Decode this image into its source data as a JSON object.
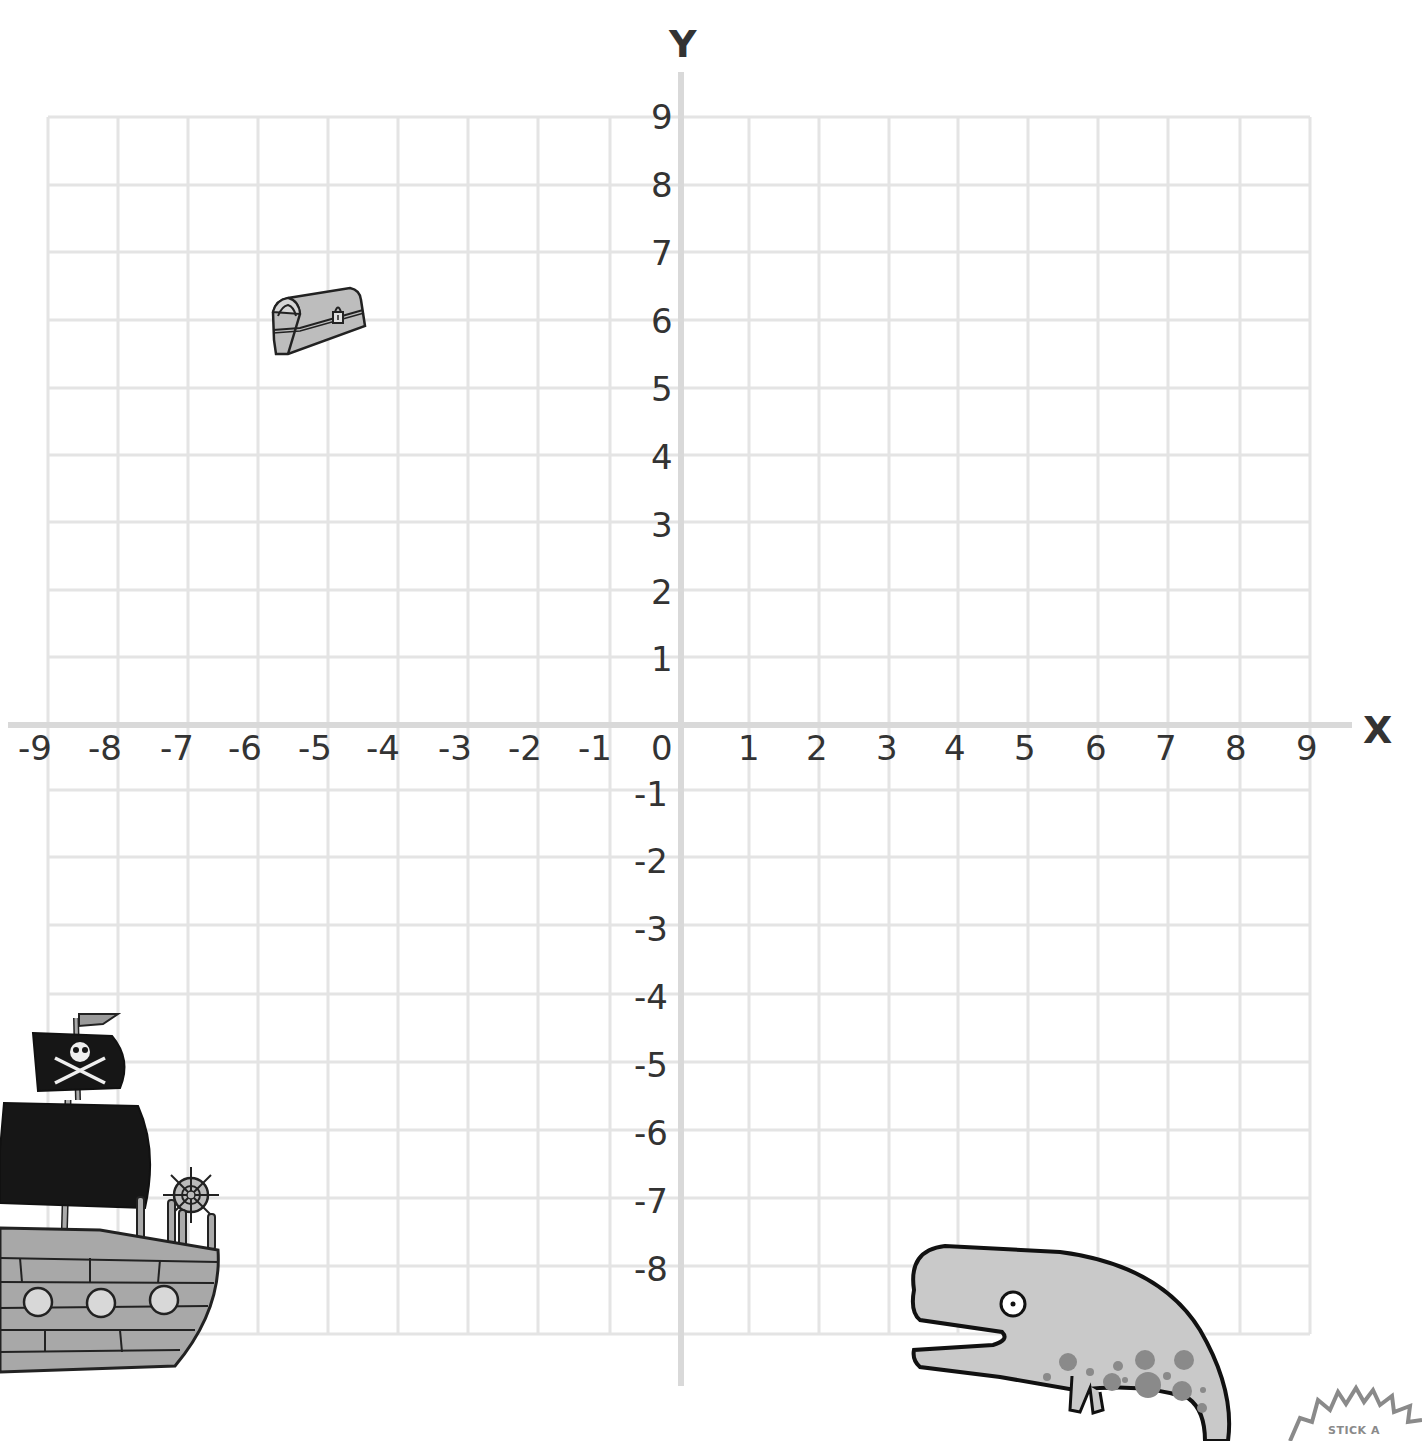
{
  "axes": {
    "x_title": "X",
    "y_title": "Y",
    "x_ticks": [
      "-9",
      "-8",
      "-7",
      "-6",
      "-5",
      "-4",
      "-3",
      "-2",
      "-1",
      "0",
      "1",
      "2",
      "3",
      "4",
      "5",
      "6",
      "7",
      "8",
      "9"
    ],
    "y_ticks_positive": [
      "9",
      "8",
      "7",
      "6",
      "5",
      "4",
      "3",
      "2",
      "1"
    ],
    "y_ticks_negative": [
      "-1",
      "-2",
      "-3",
      "-4",
      "-5",
      "-6",
      "-7",
      "-8"
    ]
  },
  "colors": {
    "grid": "#e4e4e4",
    "axis": "#dcdcdc",
    "ink": "#222222",
    "fill_gray": "#c8c8c8",
    "spot_gray": "#8a8a8a"
  },
  "pictures": [
    {
      "name": "treasure chest",
      "approx_x": -5,
      "approx_y": 6
    },
    {
      "name": "pirate ship",
      "approx_x": -8,
      "approx_y": -7
    },
    {
      "name": "whale",
      "approx_x": 5,
      "approx_y": -9
    }
  ],
  "sticker": {
    "text": "STICK A"
  },
  "chart_data": {
    "type": "scatter",
    "title": "",
    "xlabel": "X",
    "ylabel": "Y",
    "xlim": [
      -9,
      9
    ],
    "ylim": [
      -9,
      9
    ],
    "grid": true,
    "x_ticks": [
      -9,
      -8,
      -7,
      -6,
      -5,
      -4,
      -3,
      -2,
      -1,
      0,
      1,
      2,
      3,
      4,
      5,
      6,
      7,
      8,
      9
    ],
    "y_ticks": [
      -8,
      -7,
      -6,
      -5,
      -4,
      -3,
      -2,
      -1,
      1,
      2,
      3,
      4,
      5,
      6,
      7,
      8,
      9
    ],
    "points": [
      {
        "label": "treasure chest",
        "x": -5,
        "y": 6
      },
      {
        "label": "pirate ship",
        "x": -8,
        "y": -7
      },
      {
        "label": "whale",
        "x": 5,
        "y": -9
      }
    ]
  }
}
